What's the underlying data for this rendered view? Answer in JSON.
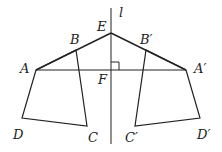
{
  "diagram": {
    "type": "geometry-reflection",
    "colors": {
      "stroke": "#222222",
      "background": "#ffffff"
    },
    "points": {
      "E": {
        "x": 111,
        "y": 33
      },
      "F": {
        "x": 111,
        "y": 70
      },
      "A": {
        "x": 36,
        "y": 70
      },
      "B": {
        "x": 76,
        "y": 50
      },
      "C": {
        "x": 87,
        "y": 126
      },
      "D": {
        "x": 22,
        "y": 118
      },
      "A'": {
        "x": 186,
        "y": 70
      },
      "B'": {
        "x": 146,
        "y": 50
      },
      "C'": {
        "x": 135,
        "y": 126
      },
      "D'": {
        "x": 200,
        "y": 118
      }
    },
    "labels": {
      "l": "l",
      "E": "E",
      "F": "F",
      "A": "A",
      "B": "B",
      "C": "C",
      "D": "D",
      "A_prime": "A′",
      "B_prime": "B′",
      "C_prime": "C′",
      "D_prime": "D′"
    },
    "annotations": [
      "right angle at F between line l and AA'"
    ]
  }
}
